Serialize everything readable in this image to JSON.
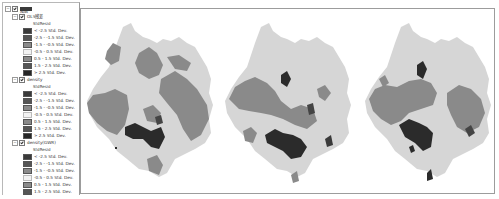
{
  "toc": {
    "root_label": "图层",
    "field_label": "StdResid",
    "layers": [
      {
        "name": "OLS残差",
        "classes": [
          {
            "label": "< -2.5 Std. Dev.",
            "color": "#3a3a3a"
          },
          {
            "label": "-2.5 - -1.5 Std. Dev.",
            "color": "#555555"
          },
          {
            "label": "-1.5 - -0.5 Std. Dev.",
            "color": "#8a8a8a"
          },
          {
            "label": "-0.5 - 0.5 Std. Dev.",
            "color": "#e6e6e6"
          },
          {
            "label": "0.5 - 1.5 Std. Dev.",
            "color": "#8a8a8a"
          },
          {
            "label": "1.5 - 2.5 Std. Dev.",
            "color": "#555555"
          },
          {
            "label": "> 2.5 Std. Dev.",
            "color": "#262626"
          }
        ]
      },
      {
        "name": "density",
        "classes": [
          {
            "label": "< -2.5 Std. Dev.",
            "color": "#3a3a3a"
          },
          {
            "label": "-2.5 - -1.5 Std. Dev.",
            "color": "#555555"
          },
          {
            "label": "-1.5 - -0.5 Std. Dev.",
            "color": "#8a8a8a"
          },
          {
            "label": "-0.5 - 0.5 Std. Dev.",
            "color": "#e6e6e6"
          },
          {
            "label": "0.5 - 1.5 Std. Dev.",
            "color": "#8a8a8a"
          },
          {
            "label": "1.5 - 2.5 Std. Dev.",
            "color": "#555555"
          },
          {
            "label": "> 2.5 Std. Dev.",
            "color": "#262626"
          }
        ]
      },
      {
        "name": "density(GWR)",
        "classes": [
          {
            "label": "< -2.5 Std. Dev.",
            "color": "#3a3a3a"
          },
          {
            "label": "-2.5 - -1.5 Std. Dev.",
            "color": "#555555"
          },
          {
            "label": "-1.5 - -0.5 Std. Dev.",
            "color": "#8a8a8a"
          },
          {
            "label": "-0.5 - 0.5 Std. Dev.",
            "color": "#e6e6e6"
          },
          {
            "label": "0.5 - 1.5 Std. Dev.",
            "color": "#8a8a8a"
          },
          {
            "label": "1.5 - 2.5 Std. Dev.",
            "color": "#555555"
          },
          {
            "label": "> 2.5 Std. Dev.",
            "color": "#262626"
          }
        ]
      }
    ]
  },
  "maps": [
    {
      "name": "map-ols-residuals"
    },
    {
      "name": "map-density"
    },
    {
      "name": "map-density-gwr"
    }
  ],
  "colors": {
    "base": "#d9d9d9",
    "mid": "#8c8c8c",
    "dark": "#2e2e2e",
    "frame": "#9c9c9c"
  }
}
